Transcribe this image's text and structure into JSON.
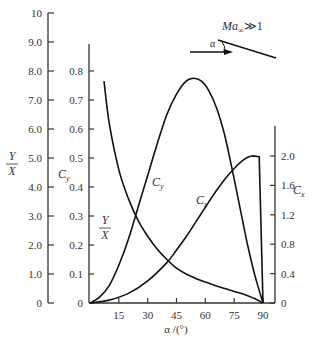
{
  "chart_data": {
    "type": "line",
    "title": "",
    "xlabel": "α/(°)",
    "x_ticks": [
      15,
      30,
      45,
      60,
      75,
      90
    ],
    "xlim": [
      0,
      90
    ],
    "axes": [
      {
        "name": "Y/X",
        "side": "left-outer",
        "ticks": [
          "0",
          "1.0",
          "2.0",
          "3.0",
          "4.0",
          "5.0",
          "6.0",
          "7.0",
          "8.0",
          "9.0",
          "10"
        ],
        "ylim": [
          0,
          10
        ]
      },
      {
        "name": "Cy",
        "side": "left-inner",
        "ticks": [
          "0",
          "0.1",
          "0.2",
          "0.3",
          "0.4",
          "0.5",
          "0.6",
          "0.7",
          "0.8"
        ],
        "ylim": [
          0,
          0.9
        ]
      },
      {
        "name": "Cx",
        "side": "right",
        "ticks": [
          "0",
          "0.4",
          "0.8",
          "1.2",
          "1.6",
          "2.0"
        ],
        "ylim": [
          0,
          2.4
        ]
      }
    ],
    "series": [
      {
        "name": "Y/X",
        "axis": "Y/X",
        "x": [
          7.3,
          10,
          15,
          20,
          25,
          30,
          35,
          40,
          45,
          50,
          55,
          60,
          65,
          70,
          75,
          80,
          85,
          90
        ],
        "values": [
          7.65,
          6.2,
          4.6,
          3.6,
          2.85,
          2.3,
          1.85,
          1.5,
          1.2,
          1.0,
          0.85,
          0.72,
          0.6,
          0.5,
          0.4,
          0.3,
          0.17,
          0
        ]
      },
      {
        "name": "Cy",
        "axis": "Cy",
        "x": [
          0,
          5,
          10,
          15,
          20,
          25,
          30,
          35,
          40,
          45,
          50,
          54,
          58,
          62,
          66,
          70,
          74,
          78,
          82,
          86,
          90
        ],
        "values": [
          0,
          0.02,
          0.06,
          0.13,
          0.22,
          0.33,
          0.44,
          0.55,
          0.65,
          0.72,
          0.765,
          0.775,
          0.765,
          0.73,
          0.67,
          0.58,
          0.46,
          0.33,
          0.2,
          0.09,
          0
        ]
      },
      {
        "name": "Cx",
        "axis": "Cx",
        "x": [
          0,
          10,
          20,
          30,
          40,
          45,
          50,
          55,
          60,
          65,
          70,
          75,
          80,
          84,
          88,
          90
        ],
        "values": [
          0,
          0.04,
          0.13,
          0.3,
          0.55,
          0.72,
          0.9,
          1.1,
          1.3,
          1.5,
          1.68,
          1.83,
          1.95,
          2.0,
          1.99,
          0
        ]
      }
    ],
    "annotations": [
      {
        "text": "Ma∞≫1",
        "type": "inset-label"
      },
      {
        "text": "α",
        "type": "inset-angle"
      }
    ],
    "grid": false,
    "legend": "inline curve labels"
  },
  "labels": {
    "yx_axis_num": "Y",
    "yx_axis_den": "X",
    "cy_axis": "C",
    "cy_axis_sub": "y",
    "cx_axis": "C",
    "cx_axis_sub": "x",
    "curve_yx_num": "Y",
    "curve_yx_den": "X",
    "curve_cy": "C",
    "curve_cy_sub": "y",
    "curve_cx": "C",
    "curve_cx_sub": "x",
    "xlabel": "α /(°)",
    "inset_ma": "Ma",
    "inset_ma_sub": "∞",
    "inset_ma_rel": "≫1",
    "inset_alpha": "α"
  }
}
